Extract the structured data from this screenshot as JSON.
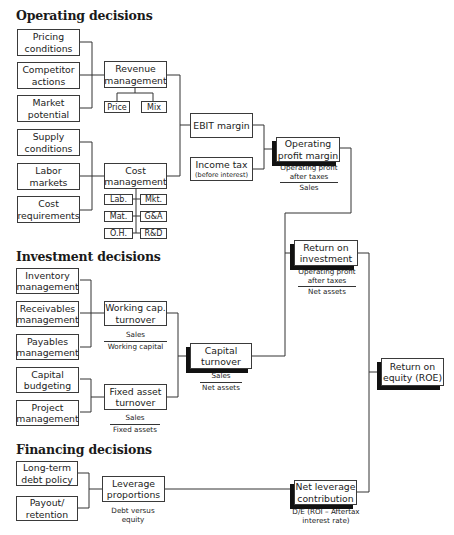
{
  "sections": {
    "operating": "Operating decisions",
    "investment": "Investment decisions",
    "financing": "Financing decisions"
  },
  "operating": {
    "drivers": [
      "Pricing conditions",
      "Competitor actions",
      "Market potential",
      "Supply conditions",
      "Labor markets",
      "Cost requirements"
    ],
    "revenue_management": "Revenue management",
    "revenue_subs": [
      "Price",
      "Mix"
    ],
    "cost_management": "Cost management",
    "cost_subs": [
      "Lab.",
      "Mkt.",
      "Mat.",
      "G&A",
      "O.H.",
      "R&D"
    ],
    "ebit_margin": "EBIT margin",
    "income_tax": "Income tax",
    "income_tax_sub": "(before interest)",
    "operating_profit_margin": "Operating profit margin",
    "opm_formula": {
      "numerator": "Operating profit after taxes",
      "denominator": "Sales"
    }
  },
  "investment": {
    "drivers": [
      "Inventory management",
      "Receivables management",
      "Payables management",
      "Capital budgeting",
      "Project management"
    ],
    "working_cap_turnover": "Working cap. turnover",
    "wct_formula": {
      "numerator": "Sales",
      "denominator": "Working capital"
    },
    "fixed_asset_turnover": "Fixed asset turnover",
    "fat_formula": {
      "numerator": "Sales",
      "denominator": "Fixed assets"
    },
    "capital_turnover": "Capital turnover",
    "ct_formula": {
      "numerator": "Sales",
      "denominator": "Net assets"
    },
    "return_on_investment": "Return on investment",
    "roi_formula": {
      "numerator": "Operating profit after taxes",
      "denominator": "Net assets"
    }
  },
  "financing": {
    "drivers": [
      "Long-term debt policy",
      "Payout/ retention"
    ],
    "leverage_proportions": "Leverage proportions",
    "leverage_note": "Debt versus equity",
    "net_leverage_contribution": "Net leverage contribution",
    "nlc_formula": "D/E (ROI – Aftertax interest rate)"
  },
  "return_on_equity": "Return on equity (ROE)"
}
